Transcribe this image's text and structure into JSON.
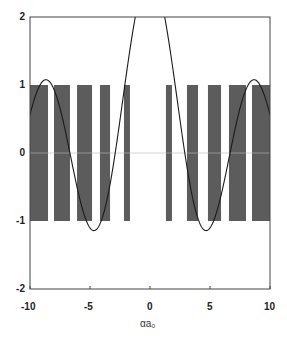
{
  "chart_data": {
    "type": "line",
    "title": "",
    "xlabel": "αa₀",
    "ylabel": "",
    "xlim": [
      -10,
      10
    ],
    "ylim": [
      -2,
      2
    ],
    "xticks": [
      "-10",
      "-5",
      "0",
      "5",
      "10"
    ],
    "yticks": [
      "2",
      "1",
      "0",
      "-1",
      "-2"
    ],
    "grid": false,
    "legend": null,
    "allowed_band_range": [
      -1,
      1
    ],
    "allowed_bands_x": [
      [
        -10.0,
        -8.5
      ],
      [
        -8.0,
        -6.67
      ],
      [
        -6.08,
        -4.83
      ],
      [
        -4.17,
        -3.33
      ],
      [
        -2.17,
        -1.67
      ],
      [
        1.33,
        1.83
      ],
      [
        3.08,
        4.0
      ],
      [
        4.83,
        5.92
      ],
      [
        6.58,
        8.0
      ],
      [
        8.5,
        10.0
      ]
    ],
    "series": [
      {
        "name": "f(αa₀)",
        "description": "Oscillating curve; exceeds 2 near center (|x|<1.5), minima about -1.65 at x≈±2.5, maxima about 1.3 at x≈±4.3, minima about -1.1 at x≈±6.4, maxima about 1.1 at x≈±8.3",
        "x": [
          -10,
          -9.2,
          -8.3,
          -7.4,
          -6.4,
          -5.4,
          -4.3,
          -3.4,
          -2.5,
          -1.8,
          -1.5,
          0,
          1.5,
          1.8,
          2.5,
          3.4,
          4.3,
          5.4,
          6.4,
          7.4,
          8.3,
          9.2,
          10
        ],
        "y": [
          -0.95,
          0.2,
          1.1,
          0.0,
          -1.1,
          0.1,
          1.3,
          0.0,
          -1.65,
          0.5,
          2.2,
          4.0,
          2.2,
          0.5,
          -1.65,
          0.0,
          1.3,
          0.1,
          -1.1,
          0.0,
          1.1,
          0.2,
          -0.95
        ]
      }
    ]
  },
  "colors": {
    "band_fill": "#5c5c5c",
    "curve": "#1a1a1a",
    "frame": "#444444",
    "background": "#ffffff"
  }
}
